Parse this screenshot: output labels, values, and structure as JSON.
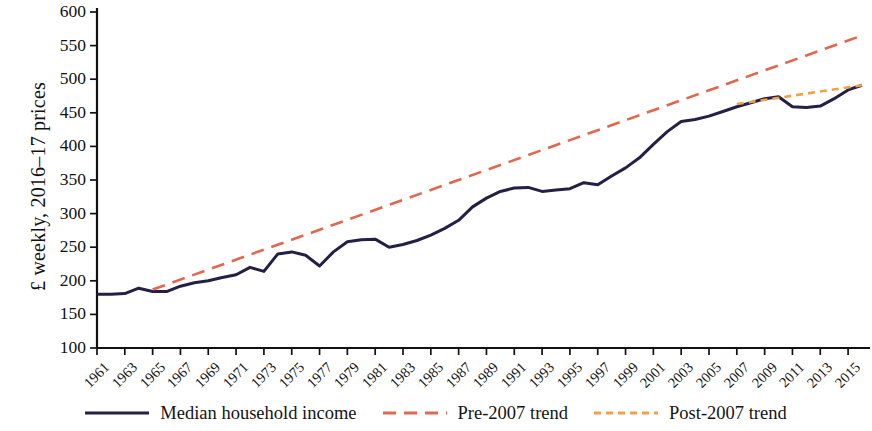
{
  "chart_data": {
    "type": "line",
    "title": "",
    "xlabel": "",
    "ylabel": "£ weekly, 2016–17 prices",
    "ylim": [
      100,
      600
    ],
    "ytick_step": 50,
    "yticks": [
      100,
      150,
      200,
      250,
      300,
      350,
      400,
      450,
      500,
      550,
      600
    ],
    "xlim": [
      1961,
      2016
    ],
    "xticks": [
      1961,
      1963,
      1965,
      1967,
      1969,
      1971,
      1973,
      1975,
      1977,
      1979,
      1981,
      1983,
      1985,
      1987,
      1989,
      1991,
      1993,
      1995,
      1997,
      1999,
      2001,
      2003,
      2005,
      2007,
      2009,
      2011,
      2013,
      2015
    ],
    "grid": false,
    "legend_position": "bottom",
    "x": [
      1961,
      1962,
      1963,
      1964,
      1965,
      1966,
      1967,
      1968,
      1969,
      1970,
      1971,
      1972,
      1973,
      1974,
      1975,
      1976,
      1977,
      1978,
      1979,
      1980,
      1981,
      1982,
      1983,
      1984,
      1985,
      1986,
      1987,
      1988,
      1989,
      1990,
      1991,
      1992,
      1993,
      1994,
      1995,
      1996,
      1997,
      1998,
      1999,
      2000,
      2001,
      2002,
      2003,
      2004,
      2005,
      2006,
      2007,
      2008,
      2009,
      2010,
      2011,
      2012,
      2013,
      2014,
      2015,
      2016
    ],
    "series": [
      {
        "name": "Median household income",
        "color": "#241f45",
        "style": "solid",
        "values": [
          180,
          180,
          181,
          189,
          184,
          184,
          192,
          197,
          200,
          205,
          209,
          220,
          214,
          240,
          243,
          238,
          222,
          243,
          258,
          261,
          262,
          250,
          254,
          260,
          268,
          278,
          290,
          310,
          323,
          333,
          338,
          339,
          333,
          335,
          337,
          346,
          343,
          356,
          368,
          383,
          403,
          422,
          437,
          440,
          445,
          452,
          459,
          465,
          471,
          474,
          459,
          458,
          460,
          471,
          484,
          491
        ]
      },
      {
        "name": "Pre-2007 trend",
        "color": "#e2674f",
        "style": "dashed",
        "x": [
          1965,
          2016
        ],
        "values": [
          187,
          565
        ]
      },
      {
        "name": "Post-2007 trend",
        "color": "#f0a14e",
        "style": "dotted",
        "x": [
          2007,
          2016
        ],
        "values": [
          463,
          491
        ]
      }
    ]
  },
  "axes": {
    "y_title": "£ weekly, 2016–17 prices",
    "ytick_labels": [
      "600",
      "550",
      "500",
      "450",
      "400",
      "350",
      "300",
      "250",
      "200",
      "150",
      "100"
    ],
    "xtick_labels": [
      "1961",
      "1963",
      "1965",
      "1967",
      "1969",
      "1971",
      "1973",
      "1975",
      "1977",
      "1979",
      "1981",
      "1983",
      "1985",
      "1987",
      "1989",
      "1991",
      "1993",
      "1995",
      "1997",
      "1999",
      "2001",
      "2003",
      "2005",
      "2007",
      "2009",
      "2011",
      "2013",
      "2015"
    ]
  },
  "legend": {
    "items": [
      {
        "label": "Median household income",
        "color": "#241f45",
        "style": "solid"
      },
      {
        "label": "Pre-2007 trend",
        "color": "#e2674f",
        "style": "dashed"
      },
      {
        "label": "Post-2007 trend",
        "color": "#f0a14e",
        "style": "dotted"
      }
    ]
  }
}
